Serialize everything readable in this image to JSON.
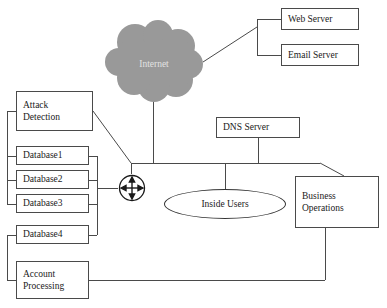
{
  "diagram": {
    "background_color": "#ffffff",
    "line_color": "#4a4a4a",
    "cloud_color": "#999999",
    "cloud_label_color": "#e2e2e2",
    "text_color": "#1a1a1a"
  },
  "nodes": {
    "internet_cloud": {
      "label": "Internet",
      "icon": "cloud-icon",
      "x": 104,
      "y": 20,
      "w": 100,
      "h": 82
    },
    "web_server": {
      "label": "Web Server",
      "x": 281,
      "y": 8,
      "w": 78,
      "h": 22
    },
    "email_server": {
      "label": "Email Server",
      "x": 281,
      "y": 44,
      "w": 78,
      "h": 22
    },
    "attack_detection": {
      "line1": "Attack",
      "line2": "Detection",
      "x": 16,
      "y": 91,
      "w": 77,
      "h": 40
    },
    "database1": {
      "label": "Database1",
      "x": 16,
      "y": 146,
      "w": 73,
      "h": 19
    },
    "database2": {
      "label": "Database2",
      "x": 16,
      "y": 170,
      "w": 73,
      "h": 19
    },
    "database3": {
      "label": "Database3",
      "x": 16,
      "y": 194,
      "w": 73,
      "h": 19
    },
    "database4": {
      "label": "Database4",
      "x": 16,
      "y": 225,
      "w": 73,
      "h": 19
    },
    "account_processing": {
      "line1": "Account",
      "line2": "Processing",
      "x": 16,
      "y": 261,
      "w": 73,
      "h": 38
    },
    "router": {
      "label": "router-icon",
      "x": 118,
      "y": 174,
      "w": 28,
      "h": 28
    },
    "dns_server": {
      "label": "DNS Server",
      "x": 216,
      "y": 117,
      "w": 84,
      "h": 21
    },
    "inside_users": {
      "label": "Inside Users",
      "x": 164,
      "y": 189,
      "w": 122,
      "h": 30
    },
    "business_operations": {
      "line1": "Business",
      "line2": "Operations",
      "x": 295,
      "y": 176,
      "w": 84,
      "h": 52
    }
  },
  "connections": [
    {
      "name": "cloud-to-servers-bracket",
      "from": "internet_cloud",
      "to": "web_server,email_server"
    },
    {
      "name": "cloud-to-backbone",
      "from": "internet_cloud",
      "to": "backbone"
    },
    {
      "name": "attack-detection-to-router",
      "from": "attack_detection",
      "to": "router"
    },
    {
      "name": "attack-detection-left-bracket",
      "from": "attack_detection",
      "to": "database1,database2,database3"
    },
    {
      "name": "databases-right-bracket-to-router",
      "from": "database1,database2,database3,database4",
      "to": "router"
    },
    {
      "name": "database4-account-left-bracket",
      "from": "database4",
      "to": "account_processing"
    },
    {
      "name": "router-to-backbone",
      "from": "router",
      "to": "backbone"
    },
    {
      "name": "dns-server-to-backbone",
      "from": "dns_server",
      "to": "backbone"
    },
    {
      "name": "inside-users-to-backbone",
      "from": "inside_users",
      "to": "backbone"
    },
    {
      "name": "backbone-to-business-operations",
      "from": "backbone",
      "to": "business_operations"
    },
    {
      "name": "business-operations-to-account-processing",
      "from": "business_operations",
      "to": "account_processing"
    }
  ]
}
